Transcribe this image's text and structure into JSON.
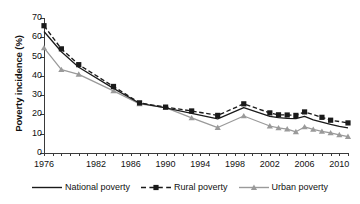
{
  "chart_data": {
    "type": "line",
    "title": "",
    "xlabel": "",
    "ylabel": "Poverty incidence (%)",
    "ylim": [
      0,
      70
    ],
    "yticks": [
      0,
      10,
      20,
      30,
      40,
      50,
      60,
      70
    ],
    "xlim": [
      1976,
      2011
    ],
    "xticks_labeled": [
      1976,
      1982,
      1986,
      1990,
      1994,
      1998,
      2002,
      2006,
      2010
    ],
    "xtick_interval_years": 1,
    "grid": false,
    "legend_position": "bottom",
    "series": [
      {
        "name": "National poverty",
        "color": "#1a1a1a",
        "style": "solid",
        "marker": "none",
        "x": [
          1976,
          1978,
          1980,
          1984,
          1987,
          1990,
          1993,
          1996,
          1999,
          2002,
          2003,
          2004,
          2005,
          2006,
          2007,
          2008,
          2009,
          2010,
          2011
        ],
        "values": [
          63.0,
          52.5,
          44.5,
          33.5,
          25.8,
          23.4,
          20.5,
          17.7,
          23.5,
          19.0,
          18.3,
          18.0,
          17.8,
          19.0,
          17.2,
          16.0,
          14.8,
          13.8,
          13.0
        ]
      },
      {
        "name": "Rural poverty",
        "color": "#1a1a1a",
        "style": "dashed",
        "marker": "square",
        "x": [
          1976,
          1978,
          1980,
          1984,
          1987,
          1990,
          1993,
          1996,
          1999,
          2002,
          2003,
          2004,
          2005,
          2006,
          2008,
          2009,
          2011
        ],
        "values": [
          66.0,
          54.0,
          45.8,
          34.5,
          26.0,
          23.8,
          21.8,
          19.5,
          25.5,
          20.8,
          19.8,
          19.7,
          19.5,
          21.3,
          18.5,
          17.0,
          15.6
        ]
      },
      {
        "name": "Urban poverty",
        "color": "#9a9a9a",
        "style": "solid",
        "marker": "triangle",
        "x": [
          1976,
          1978,
          1980,
          1984,
          1987,
          1990,
          1993,
          1996,
          1999,
          2002,
          2003,
          2004,
          2005,
          2006,
          2007,
          2008,
          2009,
          2010,
          2011
        ],
        "values": [
          54.5,
          43.2,
          40.8,
          32.2,
          25.5,
          23.5,
          18.2,
          13.2,
          19.2,
          14.0,
          13.0,
          12.4,
          11.0,
          13.5,
          12.2,
          11.2,
          10.4,
          9.4,
          8.5
        ]
      }
    ]
  },
  "legend": {
    "items": [
      {
        "label": "National poverty",
        "key": "solid-line-key"
      },
      {
        "label": "Rural poverty",
        "key": "dashed-square-key"
      },
      {
        "label": "Urban poverty",
        "key": "gray-triangle-key"
      }
    ]
  }
}
